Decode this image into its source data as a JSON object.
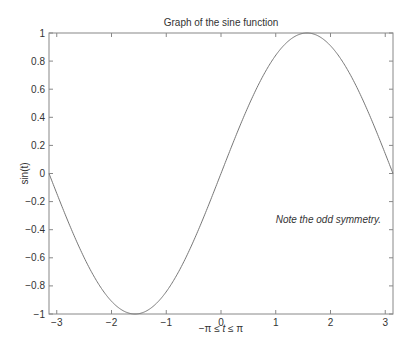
{
  "chart_data": {
    "type": "line",
    "title": "Graph of the sine function",
    "xlabel": "−π ≤ t ≤ π",
    "xlabel_parts": [
      "−π ≤ ",
      "t",
      " ≤ π"
    ],
    "ylabel": "sin(t)",
    "xlim": [
      -3.14159,
      3.14159
    ],
    "ylim": [
      -1,
      1
    ],
    "grid": false,
    "x_ticks": [
      -3,
      -2,
      -1,
      0,
      1,
      2,
      3
    ],
    "x_tick_labels": [
      "−3",
      "−2",
      "−1",
      "0",
      "1",
      "2",
      "3"
    ],
    "y_ticks": [
      1,
      0.8,
      0.6,
      0.4,
      0.2,
      0,
      -0.2,
      -0.4,
      -0.6,
      -0.8,
      -1
    ],
    "y_tick_labels": [
      "1",
      "0.8",
      "0.6",
      "0.4",
      "0.2",
      "0",
      "−0.2",
      "−0.4",
      "−0.6",
      "−0.8",
      "−1"
    ],
    "series": [
      {
        "name": "sin(t)",
        "function": "sin",
        "color": "#777777",
        "x": [
          -3.1416,
          -2.7489,
          -2.3562,
          -1.9635,
          -1.5708,
          -1.1781,
          -0.7854,
          -0.3927,
          0,
          0.3927,
          0.7854,
          1.1781,
          1.5708,
          1.9635,
          2.3562,
          2.7489,
          3.1416
        ],
        "y": [
          0,
          -0.3827,
          -0.7071,
          -0.9239,
          -1,
          -0.9239,
          -0.7071,
          -0.3827,
          0,
          0.3827,
          0.7071,
          0.9239,
          1,
          0.9239,
          0.7071,
          0.3827,
          0
        ]
      }
    ],
    "annotations": [
      {
        "text": "Note the odd symmetry.",
        "x": 1.0,
        "y": -0.333,
        "style": "italic"
      }
    ],
    "colors": {
      "axis": "#888888",
      "text": "#333333",
      "line": "#777777",
      "background": "#ffffff"
    }
  }
}
